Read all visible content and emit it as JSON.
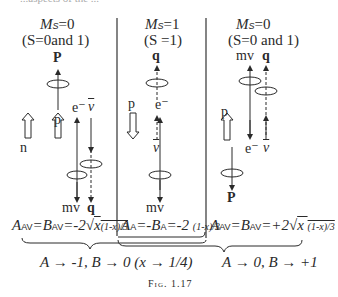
{
  "top_partial_text": "...aspects of the ...",
  "panels": [
    {
      "header_ms": "M",
      "header_ms_sub": "S",
      "header_ms_val": "=0",
      "header_s": "(S=0and 1)",
      "top_label": "P",
      "labels": {
        "n": "n",
        "p": "p",
        "e": "e⁻",
        "nu": "ν",
        "mv": "mv",
        "q": "q"
      },
      "formula": "A_AV = B_AV = -2√(x (1-x)/3)"
    },
    {
      "header_ms": "M",
      "header_ms_sub": "S",
      "header_ms_val": "=1",
      "header_s": "(S =1)",
      "top_label": "q",
      "labels": {
        "p": "p",
        "e": "e⁻",
        "nu": "ν",
        "mv": "mv"
      },
      "formula": "A_A = -B_A = -2 (1-x)/3"
    },
    {
      "header_ms": "M",
      "header_ms_sub": "S",
      "header_ms_val": "=0",
      "header_s": "(S=0 and 1)",
      "top_labels": [
        "mv",
        "q"
      ],
      "labels": {
        "p": "p",
        "e": "e⁻",
        "nu": "ν",
        "P": "P"
      },
      "formula": "A_AV = B_AV = +2√(x (1-x)/3)"
    }
  ],
  "limits": {
    "left": "A → -1, B → 0 (x → 1/4)",
    "right": "A → 0, B → +1"
  },
  "caption": "Fig. 1.17"
}
